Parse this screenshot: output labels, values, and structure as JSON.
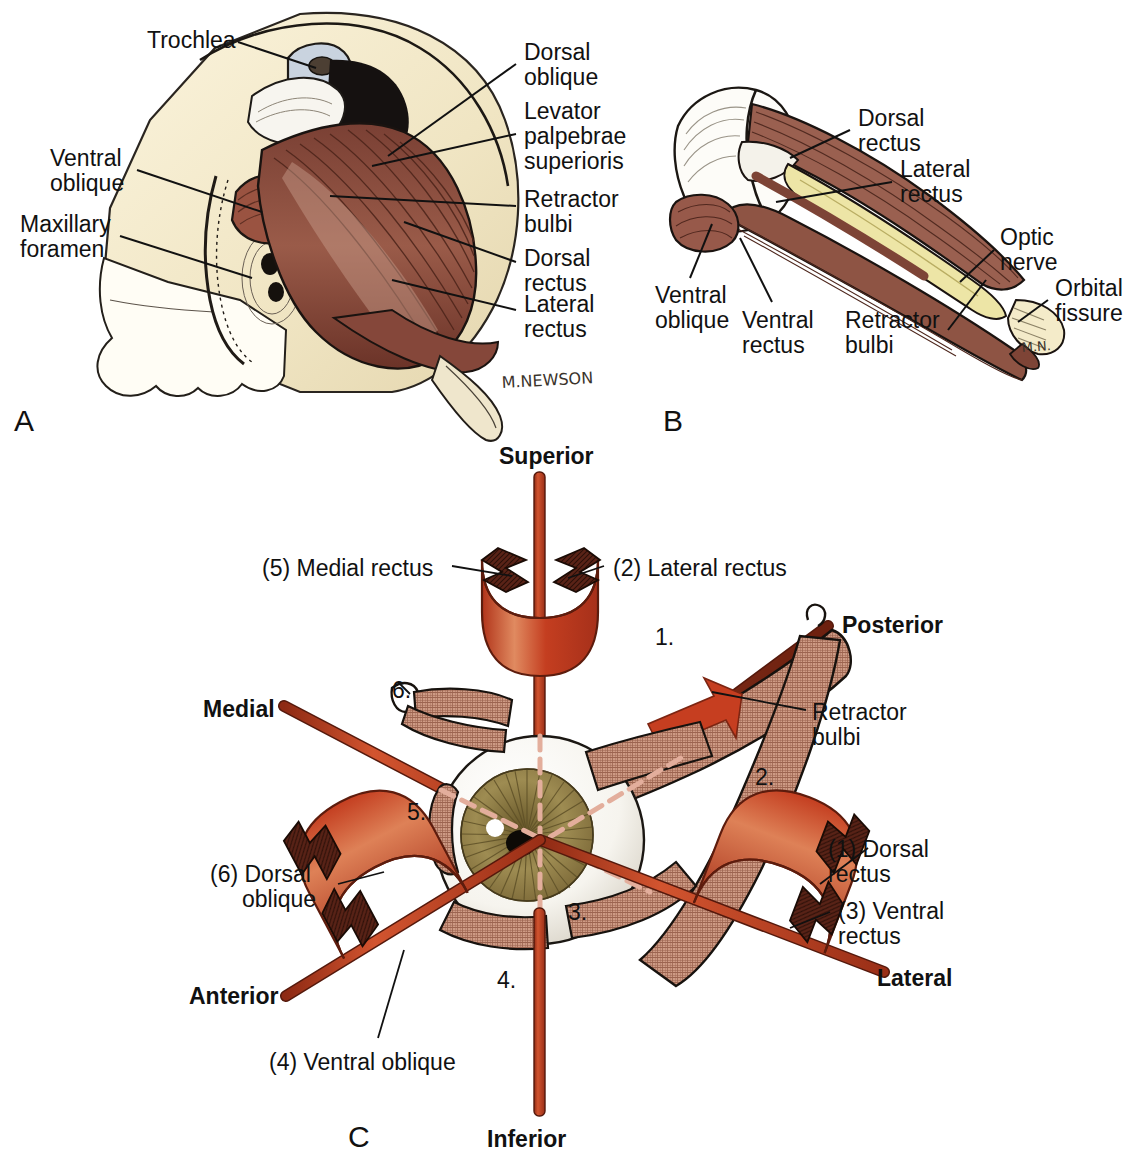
{
  "figure": {
    "panels": [
      "A",
      "B",
      "C"
    ],
    "colors": {
      "muscle_red": "#C0391B",
      "muscle_dark": "#5A2317",
      "muscle_brown": "#8D5A4A",
      "hatched_tan": "#C08A74",
      "bone_cream": "#F3E8CB",
      "nerve_yellow": "#EDE6A8",
      "sclera_white": "#FBFAF6",
      "iris_olive": "#8C7A46",
      "line_black": "#111111"
    }
  },
  "panelA": {
    "letter": "A",
    "signature": "M.NEWSON",
    "labels": [
      {
        "id": "trochlea",
        "text": "Trochlea",
        "x": 147,
        "y": 28,
        "align": "left"
      },
      {
        "id": "ventral-oblique",
        "text": "Ventral\noblique",
        "x": 50,
        "y": 146,
        "align": "left"
      },
      {
        "id": "maxillary-foramen",
        "text": "Maxillary\nforamen",
        "x": 20,
        "y": 212,
        "align": "left"
      },
      {
        "id": "dorsal-oblique",
        "text": "Dorsal\noblique",
        "x": 524,
        "y": 40,
        "align": "left"
      },
      {
        "id": "levator-palpebrae-superioris",
        "text": "Levator\npalpebrae\nsuperioris",
        "x": 524,
        "y": 99,
        "align": "left"
      },
      {
        "id": "retractor-bulbi",
        "text": "Retractor\nbulbi",
        "x": 524,
        "y": 187,
        "align": "left"
      },
      {
        "id": "dorsal-rectus",
        "text": "Dorsal\nrectus",
        "x": 524,
        "y": 246,
        "align": "left"
      },
      {
        "id": "lateral-rectus",
        "text": "Lateral\nrectus",
        "x": 524,
        "y": 292,
        "align": "left"
      }
    ]
  },
  "panelB": {
    "letter": "B",
    "signature": "M.N.",
    "labels": [
      {
        "id": "dorsal-rectus",
        "text": "Dorsal\nrectus",
        "x": 858,
        "y": 106,
        "align": "left"
      },
      {
        "id": "lateral-rectus",
        "text": "Lateral\nrectus",
        "x": 900,
        "y": 157,
        "align": "left"
      },
      {
        "id": "optic-nerve",
        "text": "Optic\nnerve",
        "x": 1000,
        "y": 225,
        "align": "left"
      },
      {
        "id": "orbital-fissure",
        "text": "Orbital\nfissure",
        "x": 1055,
        "y": 276,
        "align": "left"
      },
      {
        "id": "ventral-oblique",
        "text": "Ventral\noblique",
        "x": 655,
        "y": 283,
        "align": "left"
      },
      {
        "id": "ventral-rectus",
        "text": "Ventral\nrectus",
        "x": 742,
        "y": 308,
        "align": "left"
      },
      {
        "id": "retractor-bulbi",
        "text": "Retractor\nbulbi",
        "x": 845,
        "y": 308,
        "align": "left"
      }
    ]
  },
  "panelC": {
    "letter": "C",
    "axes": [
      {
        "id": "superior",
        "text": "Superior",
        "x": 499,
        "y": 444
      },
      {
        "id": "inferior",
        "text": "Inferior",
        "x": 487,
        "y": 1127
      },
      {
        "id": "medial",
        "text": "Medial",
        "x": 203,
        "y": 697
      },
      {
        "id": "lateral",
        "text": "Lateral",
        "x": 877,
        "y": 966
      },
      {
        "id": "posterior",
        "text": "Posterior",
        "x": 842,
        "y": 613
      },
      {
        "id": "anterior",
        "text": "Anterior",
        "x": 189,
        "y": 984
      }
    ],
    "muscle_labels": [
      {
        "id": "medial-rectus",
        "text": "(5) Medial rectus",
        "x": 262,
        "y": 556,
        "align": "left"
      },
      {
        "id": "lateral-rectus",
        "text": "(2) Lateral rectus",
        "x": 613,
        "y": 556,
        "align": "left"
      },
      {
        "id": "retractor-bulbi",
        "text": "Retractor\nbulbi",
        "x": 812,
        "y": 700,
        "align": "left"
      },
      {
        "id": "dorsal-rectus",
        "text": "(1) Dorsal\nrectus",
        "x": 828,
        "y": 837,
        "align": "left"
      },
      {
        "id": "ventral-rectus",
        "text": "(3) Ventral\nrectus",
        "x": 838,
        "y": 899,
        "align": "left"
      },
      {
        "id": "dorsal-oblique",
        "text": "(6) Dorsal\n     oblique",
        "x": 210,
        "y": 862,
        "align": "left"
      },
      {
        "id": "ventral-oblique",
        "text": "(4) Ventral oblique",
        "x": 269,
        "y": 1050,
        "align": "left"
      }
    ],
    "numeric_callouts": [
      {
        "id": "callout-1",
        "text": "1.",
        "x": 655,
        "y": 625
      },
      {
        "id": "callout-2",
        "text": "2.",
        "x": 755,
        "y": 765
      },
      {
        "id": "callout-3",
        "text": "3.",
        "x": 568,
        "y": 900
      },
      {
        "id": "callout-4",
        "text": "4.",
        "x": 497,
        "y": 968
      },
      {
        "id": "callout-5",
        "text": "5.",
        "x": 407,
        "y": 800
      },
      {
        "id": "callout-6",
        "text": "6.",
        "x": 392,
        "y": 678
      }
    ]
  }
}
